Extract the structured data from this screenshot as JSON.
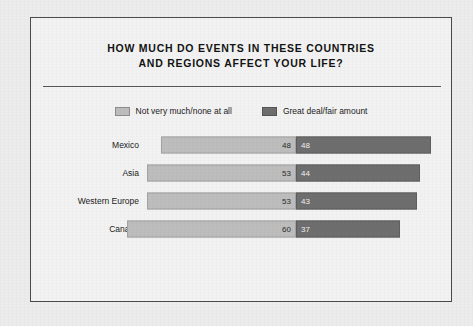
{
  "chart_data": {
    "type": "bar",
    "subtype": "diverging-stacked-horizontal",
    "title": "HOW MUCH DO EVENTS IN THESE COUNTRIES AND REGIONS AFFECT YOUR LIFE?",
    "title_line1": "HOW MUCH DO EVENTS IN THESE COUNTRIES",
    "title_line2": "AND REGIONS AFFECT YOUR LIFE?",
    "xlabel": "",
    "ylabel": "",
    "grid": false,
    "legend_position": "top-center",
    "categories": [
      "Mexico",
      "Asia",
      "Western Europe",
      "Canada"
    ],
    "series": [
      {
        "name": "Not very much/none at all",
        "color": "#bdbdbd",
        "direction": "left",
        "values": [
          48,
          53,
          53,
          60
        ]
      },
      {
        "name": "Great deal/fair amount",
        "color": "#6e6e6e",
        "direction": "right",
        "values": [
          48,
          44,
          43,
          37
        ]
      }
    ],
    "rows": [
      {
        "label": "Mexico",
        "left_value": 48,
        "right_value": 48
      },
      {
        "label": "Asia",
        "left_value": 53,
        "right_value": 44
      },
      {
        "label": "Western Europe",
        "left_value": 53,
        "right_value": 43
      },
      {
        "label": "Canada",
        "left_value": 60,
        "right_value": 37
      }
    ],
    "value_scale_px_per_unit": 2.82,
    "axis_anchor": "center-divider",
    "xlim": [
      0,
      60
    ]
  },
  "legend": {
    "items": [
      {
        "label": "Not very much/none at all",
        "swatch": "light-gray-swatch"
      },
      {
        "label": "Great deal/fair amount",
        "swatch": "dark-gray-swatch"
      }
    ]
  },
  "colors": {
    "page_background": "#ececed",
    "frame_background": "#f2f2f2",
    "frame_border": "#4a4a4c",
    "rule": "#58585a",
    "light_bar": "#bdbdbd",
    "dark_bar": "#6e6e6e",
    "text": "#131313"
  }
}
